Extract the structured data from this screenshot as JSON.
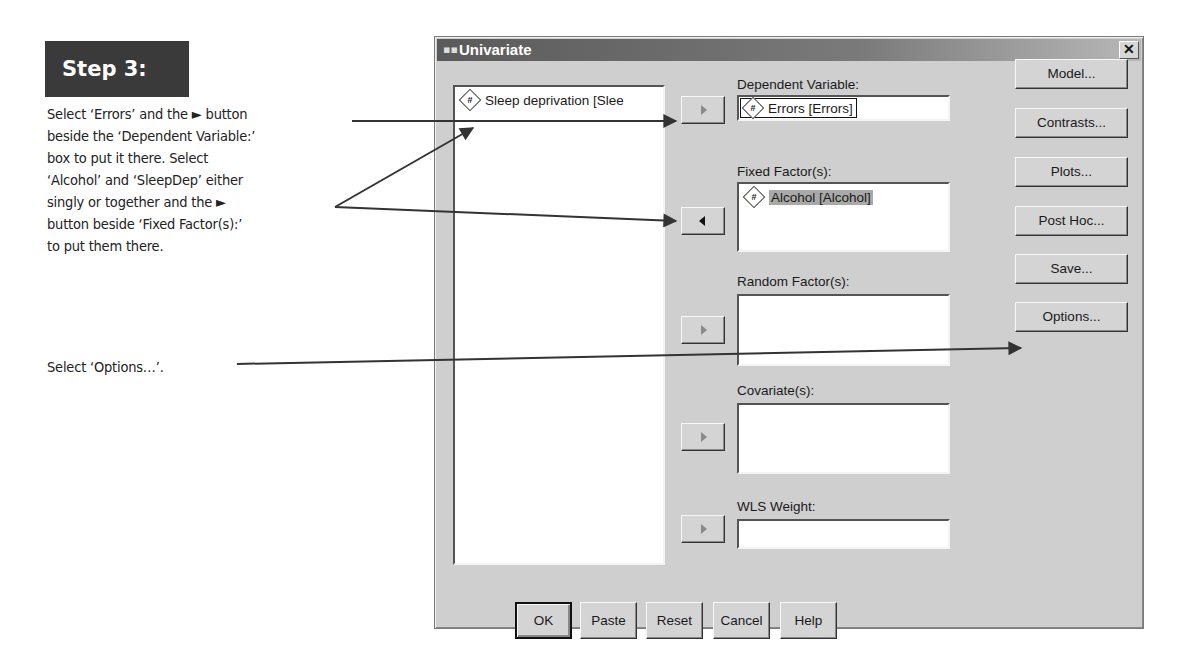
{
  "instructions": {
    "step_label": "Step 3:",
    "paragraph1_lines": [
      "Select ‘Errors’ and the ► button",
      "beside the ‘Dependent Variable:’",
      "box to put it there. Select",
      "‘Alcohol’ and ‘SleepDep’ either",
      "singly or together and the ►",
      "button beside ‘Fixed Factor(s):’",
      "to put them there."
    ],
    "paragraph2": "Select ‘Options…’."
  },
  "dialog": {
    "title": "Univariate",
    "close_label": "✕",
    "source_variables": [
      {
        "icon": "#",
        "label": "Sleep deprivation [Slee"
      }
    ],
    "fields": {
      "dependent": {
        "label": "Dependent Variable:",
        "value_icon": "#",
        "value": "Errors [Errors]"
      },
      "fixed": {
        "label": "Fixed Factor(s):",
        "items": [
          {
            "icon": "#",
            "label": "Alcohol [Alcohol]",
            "selected": true
          }
        ]
      },
      "random": {
        "label": "Random Factor(s):",
        "items": []
      },
      "covariates": {
        "label": "Covariate(s):",
        "items": []
      },
      "wls": {
        "label": "WLS Weight:",
        "value": ""
      }
    },
    "transfer_buttons": [
      {
        "target": "dependent",
        "direction": "right",
        "enabled": false
      },
      {
        "target": "fixed",
        "direction": "left",
        "enabled": true
      },
      {
        "target": "random",
        "direction": "right",
        "enabled": false
      },
      {
        "target": "covariates",
        "direction": "right",
        "enabled": false
      },
      {
        "target": "wls",
        "direction": "right",
        "enabled": false
      }
    ],
    "side_buttons": {
      "model": "Model...",
      "contrasts": "Contrasts...",
      "plots": "Plots...",
      "post_hoc": "Post Hoc...",
      "save": "Save...",
      "options": "Options..."
    },
    "bottom_buttons": {
      "ok": "OK",
      "paste": "Paste",
      "reset": "Reset",
      "cancel": "Cancel",
      "help": "Help"
    }
  }
}
